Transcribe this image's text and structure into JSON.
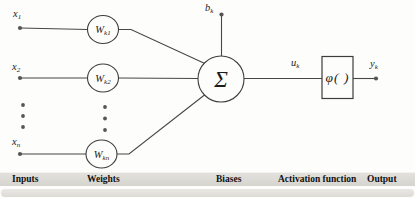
{
  "figure": {
    "inputs": [
      {
        "base": "x",
        "sub": "1"
      },
      {
        "base": "x",
        "sub": "2"
      },
      {
        "base": "x",
        "sub": "n"
      }
    ],
    "weights": [
      {
        "base": "W",
        "sub": "k1"
      },
      {
        "base": "W",
        "sub": "k2"
      },
      {
        "base": "W",
        "sub": "kn"
      }
    ],
    "bias": {
      "base": "b",
      "sub": "k"
    },
    "sum_symbol": "Σ",
    "activation_symbol": "φ( )",
    "net_input": {
      "base": "u",
      "sub": "k"
    },
    "output": {
      "base": "y",
      "sub": "k"
    }
  },
  "legend": {
    "labels": [
      "Inputs",
      "Weights",
      "Biases",
      "Activation function",
      "Output"
    ]
  },
  "colors": {
    "line": "#474747",
    "text": "#1c1c1c",
    "band_background": "#d7d6d1",
    "page_background": "#fdfdfc"
  }
}
